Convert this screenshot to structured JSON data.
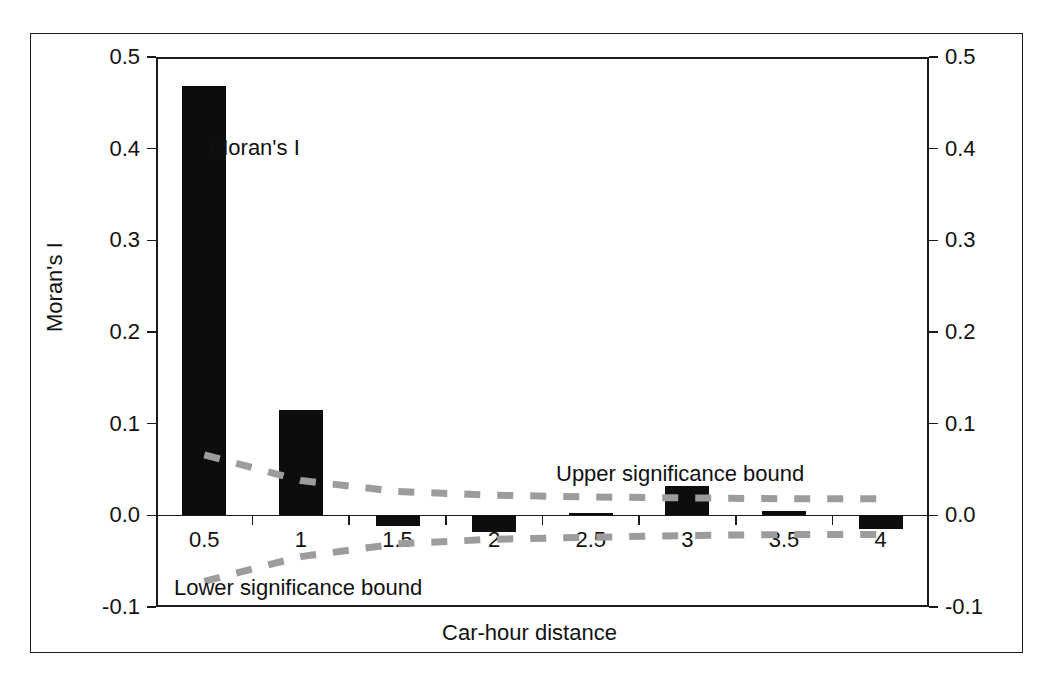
{
  "chart_data": {
    "type": "bar",
    "title": "",
    "xlabel": "Car-hour distance",
    "ylabel": "Moran's I",
    "categories": [
      "0.5",
      "1",
      "1.5",
      "2",
      "2.5",
      "3",
      "3.5",
      "4"
    ],
    "x": [
      0.5,
      1,
      1.5,
      2,
      2.5,
      3,
      3.5,
      4
    ],
    "values": [
      0.468,
      0.115,
      -0.012,
      -0.018,
      0.003,
      0.032,
      0.005,
      -0.015
    ],
    "series": [
      {
        "name": "Moran's I",
        "type": "bar",
        "values": [
          0.468,
          0.115,
          -0.012,
          -0.018,
          0.003,
          0.032,
          0.005,
          -0.015
        ]
      },
      {
        "name": "Upper significance bound",
        "type": "line",
        "style": "dashed",
        "color": "#9c9c9c",
        "values": [
          0.066,
          0.038,
          0.026,
          0.022,
          0.02,
          0.019,
          0.018,
          0.018
        ]
      },
      {
        "name": "Lower significance bound",
        "type": "line",
        "style": "dashed",
        "color": "#9c9c9c",
        "values": [
          -0.072,
          -0.045,
          -0.031,
          -0.026,
          -0.024,
          -0.022,
          -0.021,
          -0.021
        ]
      }
    ],
    "ylim": [
      -0.1,
      0.5
    ],
    "yticks": [
      -0.1,
      0.0,
      0.1,
      0.2,
      0.3,
      0.4,
      0.5
    ],
    "ytick_labels": [
      "-0.1",
      "0.0",
      "0.1",
      "0.2",
      "0.3",
      "0.4",
      "0.5"
    ],
    "ytick_labels_right": [
      "-0.1",
      "0.0",
      "0.1",
      "0.2",
      "0.3",
      "0.4",
      "0.5"
    ],
    "xtick_labels": [
      "0.5",
      "1",
      "1.5",
      "2",
      "2.5",
      "3",
      "3.5",
      "4"
    ],
    "grid": false,
    "legend": "none",
    "bar_color": "#0d0d0d",
    "axis_color": "#1a1a1a",
    "annotations": [
      {
        "id": "morans-i",
        "text": "Moran's I"
      },
      {
        "id": "upper-bound",
        "text": "Upper significance bound"
      },
      {
        "id": "lower-bound",
        "text": "Lower significance bound"
      }
    ]
  },
  "axes": {
    "y_left_title": "Moran's I",
    "x_title": "Car-hour distance",
    "y_ticks": [
      {
        "value": 0.5,
        "label": "0.5"
      },
      {
        "value": 0.4,
        "label": "0.4"
      },
      {
        "value": 0.3,
        "label": "0.3"
      },
      {
        "value": 0.2,
        "label": "0.2"
      },
      {
        "value": 0.1,
        "label": "0.1"
      },
      {
        "value": 0.0,
        "label": "0.0"
      },
      {
        "value": -0.1,
        "label": "-0.1"
      }
    ],
    "x_ticks": [
      {
        "value": 0.5,
        "label": "0.5"
      },
      {
        "value": 1,
        "label": "1"
      },
      {
        "value": 1.5,
        "label": "1.5"
      },
      {
        "value": 2,
        "label": "2"
      },
      {
        "value": 2.5,
        "label": "2.5"
      },
      {
        "value": 3,
        "label": "3"
      },
      {
        "value": 3.5,
        "label": "3.5"
      },
      {
        "value": 4,
        "label": "4"
      }
    ]
  },
  "labels": {
    "morans_i": "Moran's I",
    "upper_significance_bound": "Upper significance bound",
    "lower_significance_bound": "Lower significance bound"
  }
}
